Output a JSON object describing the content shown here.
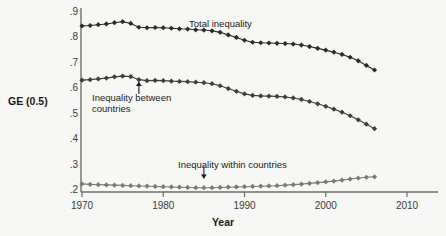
{
  "chart_data": {
    "type": "line",
    "title": "",
    "xlabel": "Year",
    "ylabel": "GE (0.5)",
    "xlim": [
      1970,
      2010
    ],
    "ylim": [
      0.2,
      0.9
    ],
    "grid": false,
    "legend_position": "inline-annotations",
    "xticks": [
      "1970",
      "1980",
      "1990",
      "2000",
      "2010"
    ],
    "xtick_values": [
      1970,
      1980,
      1990,
      2000,
      2010
    ],
    "yticks": [
      ".2",
      ".3",
      ".4",
      ".5",
      ".6",
      ".7",
      ".8",
      ".9"
    ],
    "ytick_values": [
      0.2,
      0.3,
      0.4,
      0.5,
      0.6,
      0.7,
      0.8,
      0.9
    ],
    "x": [
      1970,
      1971,
      1972,
      1973,
      1974,
      1975,
      1976,
      1977,
      1978,
      1979,
      1980,
      1981,
      1982,
      1983,
      1984,
      1985,
      1986,
      1987,
      1988,
      1989,
      1990,
      1991,
      1992,
      1993,
      1994,
      1995,
      1996,
      1997,
      1998,
      1999,
      2000,
      2001,
      2002,
      2003,
      2004,
      2005,
      2006
    ],
    "series": [
      {
        "name": "Total inequality",
        "color": "#2b2b2b",
        "marker": "diamond",
        "values": [
          0.845,
          0.847,
          0.85,
          0.853,
          0.858,
          0.862,
          0.855,
          0.84,
          0.838,
          0.839,
          0.838,
          0.836,
          0.834,
          0.833,
          0.83,
          0.829,
          0.826,
          0.82,
          0.81,
          0.8,
          0.789,
          0.781,
          0.779,
          0.778,
          0.777,
          0.776,
          0.774,
          0.77,
          0.764,
          0.757,
          0.75,
          0.742,
          0.733,
          0.722,
          0.708,
          0.69,
          0.672
        ]
      },
      {
        "name": "Inequality between countries",
        "color": "#3d3d3d",
        "marker": "diamond",
        "values": [
          0.632,
          0.634,
          0.637,
          0.64,
          0.645,
          0.648,
          0.646,
          0.634,
          0.63,
          0.631,
          0.63,
          0.628,
          0.627,
          0.626,
          0.624,
          0.622,
          0.618,
          0.61,
          0.599,
          0.588,
          0.578,
          0.572,
          0.57,
          0.569,
          0.568,
          0.566,
          0.562,
          0.556,
          0.548,
          0.539,
          0.529,
          0.518,
          0.506,
          0.492,
          0.476,
          0.459,
          0.441
        ]
      },
      {
        "name": "Inequality within countries",
        "color": "#7a7a7a",
        "marker": "diamond",
        "values": [
          0.224,
          0.222,
          0.221,
          0.22,
          0.219,
          0.218,
          0.217,
          0.216,
          0.215,
          0.214,
          0.213,
          0.212,
          0.211,
          0.21,
          0.209,
          0.209,
          0.209,
          0.21,
          0.211,
          0.212,
          0.213,
          0.214,
          0.215,
          0.216,
          0.217,
          0.219,
          0.221,
          0.223,
          0.226,
          0.229,
          0.232,
          0.235,
          0.239,
          0.243,
          0.247,
          0.25,
          0.252
        ]
      }
    ],
    "annotations": [
      {
        "id": "total",
        "text": "Total inequality",
        "x": 1984,
        "y": 0.855,
        "arrow": false
      },
      {
        "id": "between",
        "text": "Inequality between\ncountries",
        "x": 1977,
        "y": 0.625,
        "arrow": true,
        "arrow_dir": "up"
      },
      {
        "id": "within",
        "text": "Inequality within countries",
        "x": 1985,
        "y": 0.245,
        "arrow": true,
        "arrow_dir": "down"
      }
    ]
  },
  "colors": {
    "background": "#f7f7f5",
    "axis": "#6e6e6e",
    "text": "#1b1b1b",
    "tick_text": "#3b3b3b",
    "series_total": "#2b2b2b",
    "series_between": "#3d3d3d",
    "series_within": "#7a7a7a"
  }
}
